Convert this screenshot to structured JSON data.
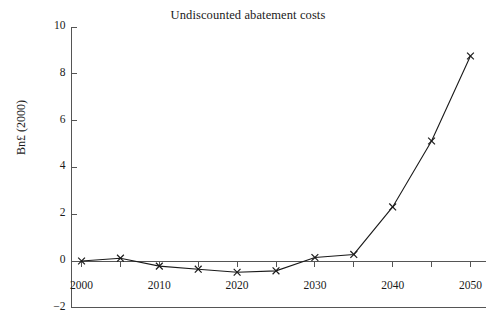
{
  "chart_data": {
    "type": "line",
    "title": "Undiscounted abatement costs",
    "xlabel": "",
    "ylabel": "Bn£ (2000)",
    "x": [
      2000,
      2005,
      2010,
      2015,
      2020,
      2025,
      2030,
      2035,
      2040,
      2045,
      2050
    ],
    "values": [
      0.0,
      0.12,
      -0.22,
      -0.35,
      -0.48,
      -0.42,
      0.15,
      0.28,
      2.31,
      5.13,
      8.76
    ],
    "series": [
      {
        "name": "Undiscounted abatement costs",
        "values": [
          0.0,
          0.12,
          -0.22,
          -0.35,
          -0.48,
          -0.42,
          0.15,
          0.28,
          2.31,
          5.13,
          8.76
        ]
      }
    ],
    "xlim": [
      1998,
      2052
    ],
    "ylim": [
      -2,
      10
    ],
    "xticks": [
      2000,
      2010,
      2020,
      2030,
      2040,
      2050
    ],
    "xtick_labels": [
      "2000",
      "2010",
      "2020",
      "2030",
      "2040",
      "2050"
    ],
    "yticks": [
      -2,
      0,
      2,
      4,
      6,
      8,
      10
    ],
    "ytick_labels": [
      "-2",
      "0",
      "2",
      "4",
      "6",
      "8",
      "10"
    ],
    "x_minor_tick_interval": 5,
    "grid": false,
    "legend": false,
    "marker": "x",
    "line_color": "#1a1a1a",
    "marker_color": "#1a1a1a",
    "axis_color": "#555555",
    "background_color": "#ffffff"
  }
}
